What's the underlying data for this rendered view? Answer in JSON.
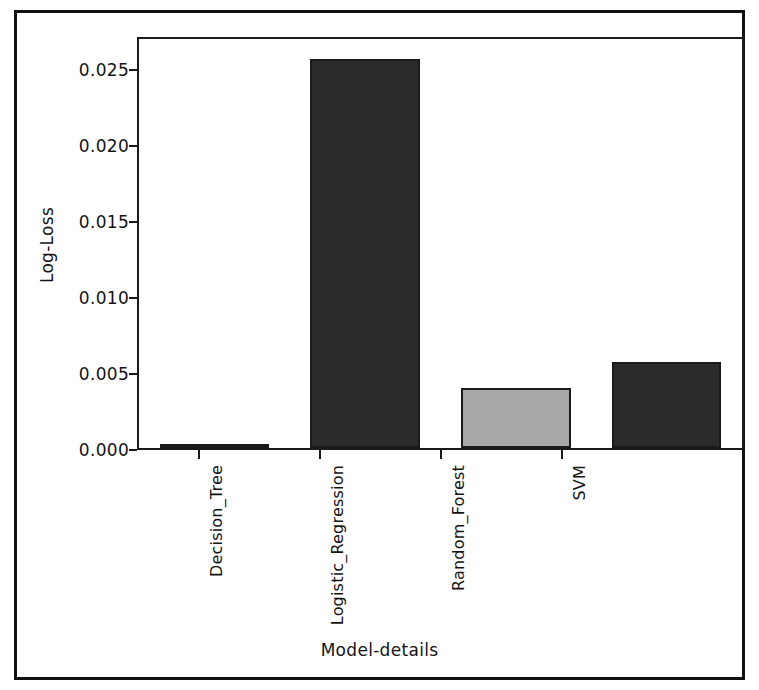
{
  "chart_data": {
    "type": "bar",
    "title": "",
    "xlabel": "Model-details",
    "ylabel": "Log-Loss",
    "categories": [
      "Decision_Tree",
      "Logistic_Regression",
      "Random_Forest",
      "SVM"
    ],
    "values": [
      0.0,
      0.0259,
      0.004,
      0.0057
    ],
    "bar_colors": [
      "#2b2b2b",
      "#2b2b2b",
      "#a8a8a8",
      "#2b2b2b"
    ],
    "bar_edge_color": "#1a1a1a",
    "ylim": [
      0.0,
      0.0272
    ],
    "yticks": [
      0.0,
      0.005,
      0.01,
      0.015,
      0.02,
      0.025
    ],
    "ytick_labels": [
      "0.000",
      "0.005",
      "0.010",
      "0.015",
      "0.020",
      "0.025"
    ],
    "grid": false,
    "legend": null,
    "xtick_rotation": 90,
    "background_color": "#ffffff",
    "frame_color": "#111111"
  }
}
